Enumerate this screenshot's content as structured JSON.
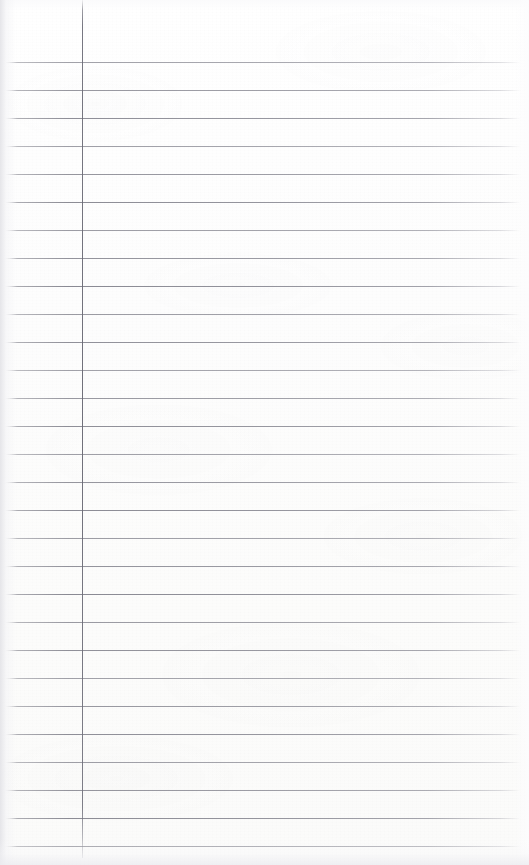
{
  "document": {
    "kind": "scanned-ruled-notebook-page",
    "page_text": "",
    "visible_text_blocks": []
  },
  "page": {
    "width": 529,
    "height": 865,
    "paper_color": "#fdfdfd",
    "background_color": "#ffffff"
  },
  "ruling": {
    "rule_color": "#848490",
    "margin_rule_color": "#6c6c77",
    "line_count": 29,
    "first_line_y": 62,
    "line_spacing": 28,
    "rule_start_x": 5,
    "rule_end_x": 521,
    "margin_rule_x": 82,
    "margin_rule_top_y": 0,
    "margin_rule_bottom_y": 858,
    "horizontal_rule_y_positions": [
      62,
      90,
      118,
      146,
      174,
      202,
      230,
      258,
      286,
      314,
      342,
      370,
      398,
      426,
      454,
      482,
      510,
      538,
      566,
      594,
      622,
      650,
      678,
      706,
      734,
      762,
      790,
      818,
      846
    ]
  },
  "regions": {
    "left_margin_label": "left margin column",
    "body_label": "ruled writing area"
  }
}
